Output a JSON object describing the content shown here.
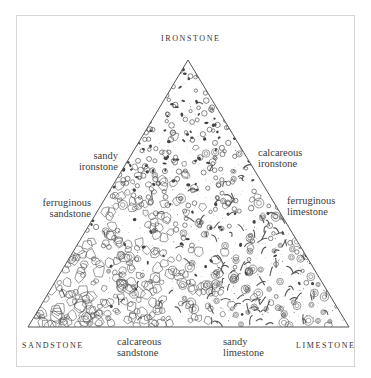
{
  "diagram": {
    "type": "ternary rock-classification triangle",
    "vertices": {
      "top": "IRONSTONE",
      "bottom_left": "SANDSTONE",
      "bottom_right": "LIMESTONE"
    },
    "edge_labels": {
      "left_upper": [
        "sandy",
        "ironstone"
      ],
      "left_lower": [
        "ferruginous",
        "sandstone"
      ],
      "right_upper": [
        "calcareous",
        "ironstone"
      ],
      "right_lower": [
        "ferruginous",
        "limestone"
      ],
      "bottom_left": [
        "calcareous",
        "sandstone"
      ],
      "bottom_right": [
        "sandy",
        "limestone"
      ]
    },
    "texture_legend": {
      "ironstone": "ooids and dark iron grains",
      "sandstone": "angular quartz grains",
      "limestone": "shell fragments and concentric oolites"
    },
    "colors": {
      "line": "#555555",
      "frame": "#d6d6d6",
      "text": "#3a3a3a"
    }
  }
}
